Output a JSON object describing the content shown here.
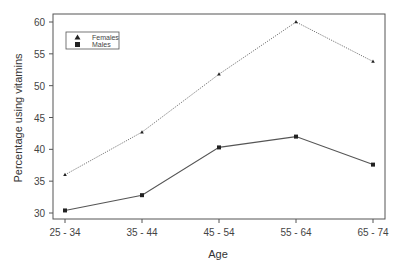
{
  "chart_data": {
    "type": "line",
    "title": "",
    "xlabel": "Age",
    "ylabel": "Percentage using vitamins",
    "categories": [
      "25 - 34",
      "35 - 44",
      "45 - 54",
      "55 - 64",
      "65 - 74"
    ],
    "series": [
      {
        "name": "Females",
        "marker": "triangle",
        "line_style": "dotted",
        "values": [
          36.0,
          42.7,
          51.8,
          60.0,
          53.8
        ]
      },
      {
        "name": "Males",
        "marker": "square",
        "line_style": "solid",
        "values": [
          30.4,
          32.8,
          40.3,
          42.0,
          37.6
        ]
      }
    ],
    "ylim": [
      30,
      60
    ],
    "yticks": [
      30,
      35,
      40,
      45,
      50,
      55,
      60
    ],
    "grid": false,
    "legend_position": "upper left"
  },
  "legend": {
    "items": [
      {
        "label": "Females",
        "icon": "triangle-marker"
      },
      {
        "label": "Males",
        "icon": "square-marker"
      }
    ]
  }
}
